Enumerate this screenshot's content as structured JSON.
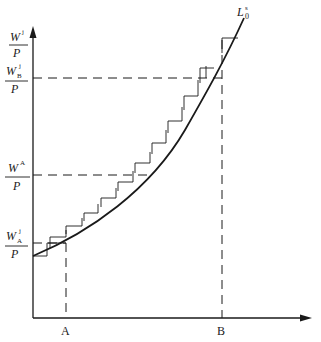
{
  "diagram": {
    "type": "labour-supply staircase diagram",
    "y_axis": {
      "label_numerator": "W",
      "label_sup": "j",
      "label_denominator": "P"
    },
    "x_axis": {
      "ticks": [
        {
          "label": "A",
          "x": 66
        },
        {
          "label": "B",
          "x": 222
        }
      ]
    },
    "curve": {
      "label_main": "L",
      "label_sub": "0",
      "label_sup": "s"
    },
    "wage_levels": [
      {
        "name": "W_B^j/P",
        "numerator": "W",
        "sup": "j",
        "sub": "B",
        "denominator": "P",
        "y": 78
      },
      {
        "name": "W^A/P",
        "numerator": "W",
        "sup": "A",
        "sub": "",
        "denominator": "P",
        "y": 175
      },
      {
        "name": "W_A^j/P",
        "numerator": "W",
        "sup": "j",
        "sub": "A",
        "denominator": "P",
        "y": 243
      }
    ],
    "colors": {
      "ink": "#1a1a1a",
      "background": "#ffffff"
    }
  }
}
